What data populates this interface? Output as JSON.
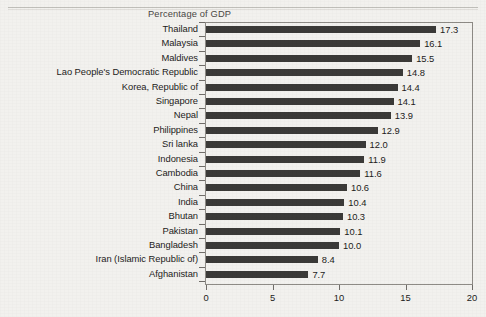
{
  "chart_title": "Percentage of GDP",
  "axis": {
    "x_ticks": [
      "0",
      "5",
      "10",
      "15",
      "20"
    ],
    "x_min": 0,
    "x_max": 20
  },
  "chart_data": {
    "type": "bar",
    "orientation": "horizontal",
    "title": "Percentage of GDP",
    "xlabel": "",
    "ylabel": "",
    "xlim": [
      0,
      20
    ],
    "grid": false,
    "legend": false,
    "bar_color": "#3b3a38",
    "categories": [
      "Thailand",
      "Malaysia",
      "Maldives",
      "Lao People's Democratic Republic",
      "Korea, Republic of",
      "Singapore",
      "Nepal",
      "Philippines",
      "Sri lanka",
      "Indonesia",
      "Cambodia",
      "China",
      "India",
      "Bhutan",
      "Pakistan",
      "Bangladesh",
      "Iran (Islamic Republic of)",
      "Afghanistan"
    ],
    "values": [
      17.3,
      16.1,
      15.5,
      14.8,
      14.4,
      14.1,
      13.9,
      12.9,
      12.0,
      11.9,
      11.6,
      10.6,
      10.4,
      10.3,
      10.1,
      10.0,
      8.4,
      7.7
    ],
    "value_labels": [
      "17.3",
      "16.1",
      "15.5",
      "14.8",
      "14.4",
      "14.1",
      "13.9",
      "12.9",
      "12.0",
      "11.9",
      "11.6",
      "10.6",
      "10.4",
      "10.3",
      "10.1",
      "10.0",
      "8.4",
      "7.7"
    ],
    "x_ticks": [
      0,
      5,
      10,
      15,
      20
    ]
  }
}
